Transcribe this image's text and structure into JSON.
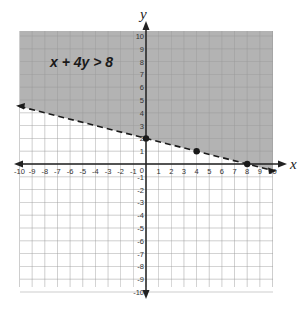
{
  "chart_data": {
    "type": "line",
    "title": "x + 4y > 8",
    "xlabel": "x",
    "ylabel": "y",
    "xlim": [
      -10,
      10
    ],
    "ylim": [
      -10,
      10
    ],
    "grid": true,
    "x_ticks": [
      -10,
      -9,
      -8,
      -7,
      -6,
      -5,
      -4,
      -3,
      -2,
      -1,
      1,
      2,
      3,
      4,
      5,
      6,
      7,
      8,
      9,
      10
    ],
    "y_ticks": [
      -10,
      -9,
      -8,
      -7,
      -6,
      -5,
      -4,
      -3,
      -2,
      -1,
      1,
      2,
      3,
      4,
      5,
      6,
      7,
      8,
      9,
      10
    ],
    "origin_label": "0",
    "boundary_line": {
      "equation": "x + 4y = 8",
      "style": "dashed",
      "from": [
        -10,
        4.5
      ],
      "to": [
        10,
        -0.5
      ]
    },
    "points": [
      {
        "x": 0,
        "y": 2
      },
      {
        "x": 4,
        "y": 1
      },
      {
        "x": 8,
        "y": 0
      }
    ],
    "shaded_region": "above line (x + 4y > 8)",
    "colors": {
      "shade": "#b3b3b3",
      "grid": "#9a9a9a",
      "axis": "#222222",
      "line": "#1a1a1a"
    }
  }
}
